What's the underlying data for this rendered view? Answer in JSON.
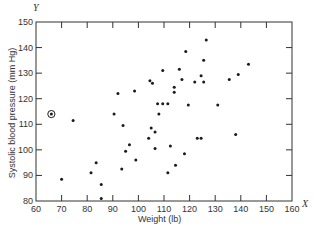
{
  "chart_data": {
    "type": "scatter",
    "title": "",
    "xlabel": "Weight (lb)",
    "ylabel": "Systolic blood pressure (mm Hg)",
    "x_axis_symbol": "X",
    "y_axis_symbol": "Y",
    "xlim": [
      60,
      160
    ],
    "ylim": [
      80,
      150
    ],
    "x_ticks": [
      60,
      70,
      80,
      90,
      100,
      110,
      120,
      130,
      140,
      150,
      160
    ],
    "y_ticks": [
      80,
      90,
      100,
      110,
      120,
      130,
      140,
      150
    ],
    "grid": false,
    "legend": null,
    "highlighted_point": {
      "x": 66,
      "y": 114,
      "marker": "circled-dot",
      "note": "circled outlier"
    },
    "points": [
      {
        "x": 66,
        "y": 114
      },
      {
        "x": 70,
        "y": 88.5
      },
      {
        "x": 74.5,
        "y": 111.5
      },
      {
        "x": 81.5,
        "y": 91
      },
      {
        "x": 83.5,
        "y": 95
      },
      {
        "x": 85.5,
        "y": 86.5
      },
      {
        "x": 85.5,
        "y": 81
      },
      {
        "x": 90.5,
        "y": 114
      },
      {
        "x": 92,
        "y": 122
      },
      {
        "x": 93.5,
        "y": 92.5
      },
      {
        "x": 94,
        "y": 109.5
      },
      {
        "x": 95,
        "y": 99.5
      },
      {
        "x": 96.5,
        "y": 102
      },
      {
        "x": 98.5,
        "y": 123
      },
      {
        "x": 99,
        "y": 96
      },
      {
        "x": 104,
        "y": 104.5
      },
      {
        "x": 104.5,
        "y": 127
      },
      {
        "x": 105.5,
        "y": 126
      },
      {
        "x": 105,
        "y": 108.5
      },
      {
        "x": 106.5,
        "y": 107
      },
      {
        "x": 106.5,
        "y": 100.5
      },
      {
        "x": 108,
        "y": 114
      },
      {
        "x": 107.5,
        "y": 118
      },
      {
        "x": 109.5,
        "y": 118
      },
      {
        "x": 109.5,
        "y": 131
      },
      {
        "x": 111.5,
        "y": 118
      },
      {
        "x": 111.5,
        "y": 91
      },
      {
        "x": 112.5,
        "y": 101.5
      },
      {
        "x": 114,
        "y": 122.5
      },
      {
        "x": 114,
        "y": 124.5
      },
      {
        "x": 114.5,
        "y": 94
      },
      {
        "x": 116,
        "y": 131.5
      },
      {
        "x": 117,
        "y": 127.5
      },
      {
        "x": 118,
        "y": 98.5
      },
      {
        "x": 118.5,
        "y": 138.5
      },
      {
        "x": 119.5,
        "y": 117.5
      },
      {
        "x": 122,
        "y": 126.5
      },
      {
        "x": 123,
        "y": 104.5
      },
      {
        "x": 124.5,
        "y": 104.5
      },
      {
        "x": 124.5,
        "y": 129
      },
      {
        "x": 125.5,
        "y": 126.5
      },
      {
        "x": 125.5,
        "y": 135
      },
      {
        "x": 126.5,
        "y": 143
      },
      {
        "x": 131,
        "y": 117.5
      },
      {
        "x": 135.5,
        "y": 127.5
      },
      {
        "x": 138,
        "y": 106
      },
      {
        "x": 139,
        "y": 129.5
      },
      {
        "x": 143,
        "y": 133.5
      }
    ]
  },
  "colors": {
    "axis": "#333333",
    "point": "#1a1a1a",
    "background": "#ffffff"
  }
}
